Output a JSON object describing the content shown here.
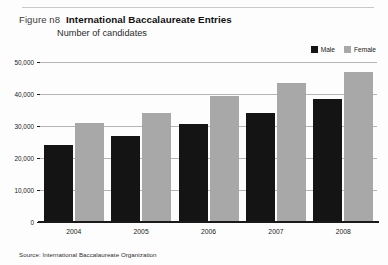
{
  "figure": {
    "number_label": "Figure n8",
    "title": "International Baccalaureate Entries",
    "subtitle": "Number of candidates",
    "source": "Source: International Baccalaureate Organization"
  },
  "legend": {
    "position": "top-right",
    "items": [
      {
        "label": "Male",
        "color": "#141414"
      },
      {
        "label": "Female",
        "color": "#a8a8a8"
      }
    ]
  },
  "chart_data": {
    "type": "bar",
    "title": "International Baccalaureate Entries",
    "subtitle": "Number of candidates",
    "xlabel": "",
    "ylabel": "Number of candidates",
    "categories": [
      "2004",
      "2005",
      "2006",
      "2007",
      "2008"
    ],
    "series": [
      {
        "name": "Male",
        "color": "#141414",
        "values": [
          24000,
          27000,
          30500,
          34000,
          38500
        ]
      },
      {
        "name": "Female",
        "color": "#a8a8a8",
        "values": [
          31000,
          34000,
          39500,
          43500,
          47000
        ]
      }
    ],
    "ylim": [
      0,
      50000
    ],
    "yticks": [
      0,
      10000,
      20000,
      30000,
      40000,
      50000
    ],
    "ytick_labels": [
      "0",
      "10,000",
      "20,000",
      "30,000",
      "40,000",
      "50,000"
    ],
    "grid": true,
    "legend_position": "top-right"
  }
}
